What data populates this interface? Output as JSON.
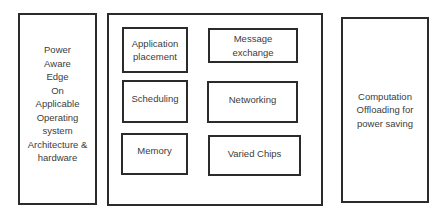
{
  "diagram": {
    "left_box": {
      "lines": [
        "Power",
        "Aware",
        "Edge",
        "On",
        "Applicable",
        "Operating",
        "system",
        "Architecture &",
        "hardware"
      ]
    },
    "center_box": {
      "items": [
        {
          "lines": [
            "Application",
            "placement"
          ]
        },
        {
          "lines": [
            "Message",
            "exchange"
          ]
        },
        {
          "lines": [
            "Scheduling"
          ]
        },
        {
          "lines": [
            "Networking"
          ]
        },
        {
          "lines": [
            "Memory"
          ]
        },
        {
          "lines": [
            "Varied Chips"
          ]
        }
      ]
    },
    "right_box": {
      "lines": [
        "Computation",
        "Offloading for",
        "power saving"
      ]
    },
    "colors": {
      "border": "#2b2b2b",
      "text": "#3c3c3c",
      "background": "#ffffff"
    }
  }
}
